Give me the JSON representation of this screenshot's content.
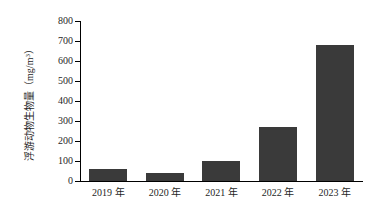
{
  "chart_data": {
    "type": "bar",
    "title": "",
    "subtitle": "",
    "xlabel": "",
    "ylabel": "浮游动物生物量（mg/m³）",
    "ylabel_text": "浮游动物生物量（mg/m",
    "ylabel_exponent": "3",
    "ylabel_close": "）",
    "categories": [
      "2019 年",
      "2020 年",
      "2021 年",
      "2022 年",
      "2023 年"
    ],
    "values": [
      58,
      38,
      100,
      270,
      680
    ],
    "ylim": [
      0,
      800
    ],
    "yticks": [
      0,
      100,
      200,
      300,
      400,
      500,
      600,
      700,
      800
    ],
    "ytick_labels": [
      "0",
      "100",
      "200",
      "300",
      "400",
      "500",
      "600",
      "700",
      "800"
    ],
    "grid": false,
    "legend": false,
    "legend_position": "none",
    "bar_color": "#3a3a3a",
    "axis_color": "#000000",
    "background_color": "#ffffff"
  }
}
